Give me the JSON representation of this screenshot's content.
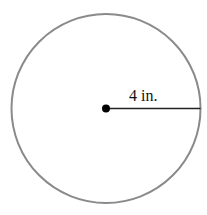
{
  "diagram": {
    "shape": "circle",
    "radius_label": "4 in.",
    "colors": {
      "circle_stroke": "#8a8a8a",
      "radius_line": "#222222",
      "center_dot": "#000000",
      "background": "#ffffff"
    }
  }
}
